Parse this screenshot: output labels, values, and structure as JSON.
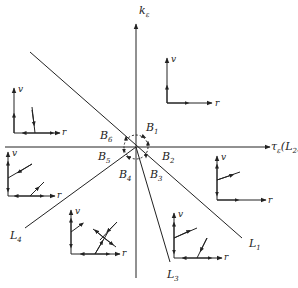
{
  "axes": {
    "vertical_label": "k",
    "vertical_sub": "ε",
    "horizontal_label": "τ",
    "horizontal_sub": "ε",
    "horizontal_suffix": "(L",
    "horizontal_suffix_sub": "2",
    "horizontal_close": ")"
  },
  "lines": [
    {
      "name": "L",
      "sub": "1"
    },
    {
      "name": "L",
      "sub": "3"
    },
    {
      "name": "L",
      "sub": "4"
    }
  ],
  "regions": [
    {
      "name": "B",
      "sub": "1"
    },
    {
      "name": "B",
      "sub": "2"
    },
    {
      "name": "B",
      "sub": "3"
    },
    {
      "name": "B",
      "sub": "4"
    },
    {
      "name": "B",
      "sub": "5"
    },
    {
      "name": "B",
      "sub": "6"
    }
  ],
  "phase_portraits": {
    "axis_v": "v",
    "axis_r": "r"
  },
  "colors": {
    "stroke": "#222222",
    "background": "#ffffff"
  }
}
